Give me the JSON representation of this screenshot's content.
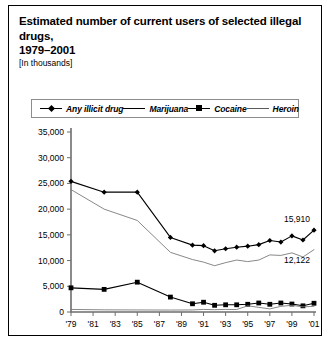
{
  "figure": {
    "title_line1": "Estimated number of current users of selected illegal drugs,",
    "title_line2": "1979–2001",
    "subtitle": "[In thousands]"
  },
  "legend": {
    "items": [
      {
        "label": "Any illicit drug",
        "key": "line-with-diamond-marker"
      },
      {
        "label": "Marijuana",
        "key": "plain-line"
      },
      {
        "label": "Cocaine",
        "key": "line-with-square-marker"
      },
      {
        "label": "Heroin",
        "key": "plain-thin-line"
      }
    ]
  },
  "chart_data": {
    "type": "line",
    "title": "Estimated number of current users of selected illegal drugs, 1979–2001",
    "subtitle": "[In thousands]",
    "xlabel": "",
    "ylabel": "",
    "xlim": [
      1979,
      2001
    ],
    "ylim": [
      0,
      35000
    ],
    "ytick_labels": [
      "35,000",
      "30,000",
      "25,000",
      "20,000",
      "15,000",
      "10,000",
      "5,000",
      "0"
    ],
    "ytick_values": [
      35000,
      30000,
      25000,
      20000,
      15000,
      10000,
      5000,
      0
    ],
    "xtick_labels": [
      "'79",
      "'81",
      "'83",
      "'85",
      "'87",
      "'89",
      "'91",
      "'93",
      "'95",
      "'97",
      "'99",
      "'01"
    ],
    "xtick_values": [
      1979,
      1981,
      1983,
      1985,
      1987,
      1989,
      1991,
      1993,
      1995,
      1997,
      1999,
      2001
    ],
    "grid": false,
    "legend_position": "top",
    "series": [
      {
        "name": "Any illicit drug",
        "marker": "diamond",
        "x": [
          1979,
          1982,
          1985,
          1988,
          1990,
          1991,
          1992,
          1993,
          1994,
          1995,
          1996,
          1997,
          1998,
          1999,
          2000,
          2001
        ],
        "values": [
          25400,
          23300,
          23300,
          14500,
          13000,
          12900,
          11900,
          12300,
          12600,
          12800,
          13100,
          13900,
          13600,
          14800,
          14000,
          15910
        ]
      },
      {
        "name": "Marijuana",
        "marker": "none",
        "x": [
          1979,
          1982,
          1985,
          1988,
          1990,
          1991,
          1992,
          1993,
          1994,
          1995,
          1996,
          1997,
          1998,
          1999,
          2000,
          2001
        ],
        "values": [
          23800,
          20000,
          17800,
          11600,
          10200,
          9700,
          9000,
          9600,
          10100,
          9800,
          10100,
          11100,
          11000,
          11500,
          10700,
          12122
        ]
      },
      {
        "name": "Cocaine",
        "marker": "square",
        "x": [
          1979,
          1982,
          1985,
          1988,
          1990,
          1991,
          1992,
          1993,
          1994,
          1995,
          1996,
          1997,
          1998,
          1999,
          2000,
          2001
        ],
        "values": [
          4700,
          4400,
          5800,
          2900,
          1600,
          1900,
          1300,
          1400,
          1400,
          1500,
          1750,
          1500,
          1750,
          1550,
          1200,
          1700
        ]
      },
      {
        "name": "Heroin",
        "marker": "none",
        "x": [
          1979,
          1982,
          1985,
          1988,
          1990,
          1991,
          1992,
          1993,
          1994,
          1995,
          1996,
          1997,
          1998,
          1999,
          2000,
          2001
        ],
        "values": [
          500,
          420,
          400,
          380,
          400,
          500,
          450,
          500,
          480,
          1200,
          900,
          600,
          1100,
          1300,
          1000,
          1100
        ]
      }
    ],
    "annotations": [
      {
        "text": "15,910",
        "series": "Any illicit drug",
        "x": 2001,
        "y": 15910
      },
      {
        "text": "12,122",
        "series": "Marijuana",
        "x": 2001,
        "y": 12122
      }
    ]
  }
}
